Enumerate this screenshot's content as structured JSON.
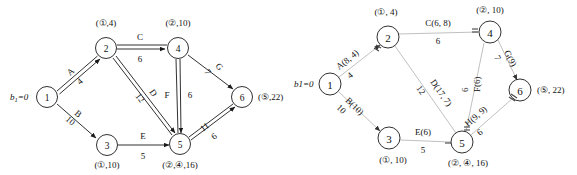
{
  "figure": {
    "title": "",
    "panels": [
      "left-network-flow-diagram",
      "right-network-flow-diagram"
    ]
  },
  "source_label": {
    "text": "b",
    "subscript": "1",
    "equals": "=0",
    "plain": "b1=0"
  },
  "left": {
    "nodes": [
      {
        "id": "1",
        "num": "1",
        "label": "",
        "cx": 47,
        "cy": 97
      },
      {
        "id": "2",
        "num": "2",
        "label": "(①,4)",
        "cx": 106,
        "cy": 48
      },
      {
        "id": "3",
        "num": "3",
        "label": "(①,10)",
        "cx": 107,
        "cy": 145
      },
      {
        "id": "4",
        "num": "4",
        "label": "(②,10)",
        "cx": 178,
        "cy": 48
      },
      {
        "id": "5",
        "num": "5",
        "label": "(②,④,16)",
        "cx": 180,
        "cy": 144
      },
      {
        "id": "6",
        "num": "6",
        "label": "(⑤,22)",
        "cx": 242,
        "cy": 97
      }
    ],
    "edges": [
      {
        "id": "A",
        "from": "1",
        "to": "2",
        "name": "A",
        "value": "4",
        "double": true
      },
      {
        "id": "B",
        "from": "1",
        "to": "3",
        "name": "B",
        "value": "10",
        "double": false
      },
      {
        "id": "C",
        "from": "2",
        "to": "4",
        "name": "C",
        "value": "6",
        "double": true
      },
      {
        "id": "D",
        "from": "2",
        "to": "5",
        "name": "D",
        "value": "12",
        "double": true
      },
      {
        "id": "E",
        "from": "3",
        "to": "5",
        "name": "E",
        "value": "5",
        "double": false
      },
      {
        "id": "F",
        "from": "4",
        "to": "5",
        "name": "F",
        "value": "6",
        "double": true
      },
      {
        "id": "G",
        "from": "4",
        "to": "6",
        "name": "G",
        "value": "7",
        "double": false
      },
      {
        "id": "H",
        "from": "5",
        "to": "6",
        "name": "H",
        "value": "6",
        "double": true,
        "extra": "11"
      }
    ]
  },
  "right": {
    "nodes": [
      {
        "id": "1",
        "num": "1",
        "label": "",
        "cx": 40,
        "cy": 84
      },
      {
        "id": "2",
        "num": "2",
        "label": "(①, 4)",
        "cx": 98,
        "cy": 37
      },
      {
        "id": "3",
        "num": "3",
        "label": "(①, 10)",
        "cx": 99,
        "cy": 138
      },
      {
        "id": "4",
        "num": "4",
        "label": "(②, 10)",
        "cx": 200,
        "cy": 32
      },
      {
        "id": "5",
        "num": "5",
        "label": "(②, ④, 16)",
        "cx": 172,
        "cy": 142
      },
      {
        "id": "6",
        "num": "6",
        "label": "(⑤, 22)",
        "cx": 230,
        "cy": 90
      }
    ],
    "edges": [
      {
        "id": "A",
        "from": "1",
        "to": "2",
        "name": "A(8, 4)",
        "value": "4"
      },
      {
        "id": "B",
        "from": "1",
        "to": "3",
        "name": "B(10)",
        "value": "10"
      },
      {
        "id": "C",
        "from": "2",
        "to": "4",
        "name": "C(6, 8)",
        "value": "6"
      },
      {
        "id": "D",
        "from": "2",
        "to": "5",
        "name": "D(17, 7)",
        "value": "12"
      },
      {
        "id": "E",
        "from": "3",
        "to": "5",
        "name": "E(6)",
        "value": "5"
      },
      {
        "id": "F",
        "from": "4",
        "to": "5",
        "name": "F(6)",
        "value": "6"
      },
      {
        "id": "G",
        "from": "4",
        "to": "6",
        "name": "G(9)",
        "value": "7"
      },
      {
        "id": "H",
        "from": "5",
        "to": "6",
        "name": "H(9, 9)",
        "value": "6"
      }
    ]
  },
  "colors": {
    "ink": "#111111",
    "pale_edge": "#b9b9b9",
    "background": "#ffffff"
  }
}
